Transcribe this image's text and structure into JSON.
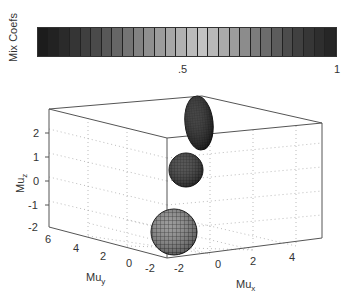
{
  "colorbar": {
    "label": "Mix Coefs",
    "tick_labels": [
      ".5",
      "1"
    ],
    "cells": 28,
    "colors": [
      "#1c1c1c",
      "#222222",
      "#2a2a2a",
      "#353535",
      "#3f3f3f",
      "#4a4a4a",
      "#585858",
      "#666666",
      "#747474",
      "#828282",
      "#8f8f8f",
      "#9c9c9c",
      "#a7a7a7",
      "#b1b1b1",
      "#bbbbbb",
      "#c3c3c3",
      "#b8b8b8",
      "#aaaaaa",
      "#9c9c9c",
      "#8c8c8c",
      "#7c7c7c",
      "#6c6c6c",
      "#5c5c5c",
      "#4c4c4c",
      "#404040",
      "#363636",
      "#2e2e2e",
      "#262626"
    ]
  },
  "axes": {
    "z_label": "Mu",
    "z_sub": "z",
    "y_label": "Mu",
    "y_sub": "y",
    "x_label": "Mu",
    "x_sub": "x",
    "z_ticks": [
      "2",
      "1",
      "0",
      "-1",
      "-2"
    ],
    "y_ticks": [
      "6",
      "4",
      "2",
      "0",
      "-2"
    ],
    "x_ticks": [
      "-2",
      "0",
      "2",
      "4"
    ]
  },
  "chart_data": [
    {
      "type": "heatmap",
      "title": "Mix Coefs",
      "orientation": "horizontal colorbar",
      "range": [
        0,
        1
      ],
      "tick_labels": [
        ".5",
        "1"
      ],
      "colormap": "gray, dark at ends, lightest near 0.55"
    },
    {
      "type": "scatter",
      "title": "",
      "subtype": "3d gaussian ellipsoids",
      "xlabel": "Mu_x",
      "ylabel": "Mu_y",
      "zlabel": "Mu_z",
      "xlim": [
        -2,
        5
      ],
      "ylim": [
        -2,
        7
      ],
      "zlim": [
        -2,
        3
      ],
      "grid": true,
      "components": [
        {
          "name": "component-1",
          "mu": [
            0,
            -2,
            -2
          ],
          "shape": "sphere",
          "relative_size": "large",
          "shade": "mid-gray"
        },
        {
          "name": "component-2",
          "mu": [
            0,
            0,
            0.5
          ],
          "shape": "sphere",
          "relative_size": "medium",
          "shade": "dark"
        },
        {
          "name": "component-3",
          "mu": [
            0,
            1,
            2.5
          ],
          "shape": "elongated ellipsoid",
          "relative_size": "tall",
          "shade": "darkest"
        }
      ]
    }
  ]
}
